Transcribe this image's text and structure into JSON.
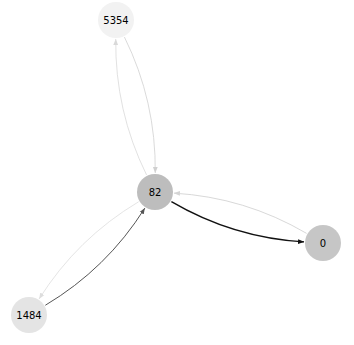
{
  "diagram": {
    "type": "directed-graph",
    "nodes": [
      {
        "id": "5354",
        "label": "5354",
        "x": 116,
        "y": 20,
        "r": 18,
        "fill": "#f2f2f2"
      },
      {
        "id": "82",
        "label": "82",
        "x": 155,
        "y": 192,
        "r": 18,
        "fill": "#bdbdbd"
      },
      {
        "id": "0",
        "label": "0",
        "x": 323,
        "y": 243,
        "r": 18,
        "fill": "#c6c6c6"
      },
      {
        "id": "1484",
        "label": "1484",
        "x": 29,
        "y": 315,
        "r": 18,
        "fill": "#e4e4e4"
      }
    ],
    "edges": [
      {
        "from": "82",
        "to": "5354",
        "color": "#d9d9d9",
        "width": 0.8,
        "bend": -0.12
      },
      {
        "from": "5354",
        "to": "82",
        "color": "#d0d0d0",
        "width": 0.8,
        "bend": -0.12
      },
      {
        "from": "82",
        "to": "0",
        "color": "#111111",
        "width": 1.4,
        "bend": 0.12
      },
      {
        "from": "0",
        "to": "82",
        "color": "#d4d4d4",
        "width": 0.9,
        "bend": 0.12
      },
      {
        "from": "1484",
        "to": "82",
        "color": "#555555",
        "width": 1.0,
        "bend": 0.12
      },
      {
        "from": "82",
        "to": "1484",
        "color": "#dddddd",
        "width": 0.8,
        "bend": 0.12
      }
    ]
  }
}
